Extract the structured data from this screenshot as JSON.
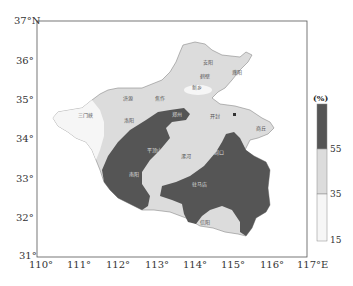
{
  "map": {
    "region": "Henan Province",
    "frame": {
      "lon_min": 110,
      "lon_max": 117,
      "lat_min": 31,
      "lat_max": 37
    },
    "x_ticks": [
      "110°",
      "111°",
      "112°",
      "113°",
      "114°",
      "115°",
      "116°",
      "117°E"
    ],
    "y_ticks": [
      "37°N",
      "36°",
      "35°",
      "34°",
      "33°",
      "32°",
      "31°"
    ],
    "cities": [
      {
        "name": "安阳",
        "x": 203,
        "y": 60
      },
      {
        "name": "鹤壁",
        "x": 200,
        "y": 74
      },
      {
        "name": "濮阳",
        "x": 232,
        "y": 70
      },
      {
        "name": "新乡",
        "x": 192,
        "y": 85
      },
      {
        "name": "焦作",
        "x": 155,
        "y": 96
      },
      {
        "name": "济源",
        "x": 123,
        "y": 96
      },
      {
        "name": "三门峡",
        "x": 80,
        "y": 113
      },
      {
        "name": "洛阳",
        "x": 124,
        "y": 118
      },
      {
        "name": "郑州",
        "x": 172,
        "y": 112
      },
      {
        "name": "开封",
        "x": 210,
        "y": 114
      },
      {
        "name": "商丘",
        "x": 257,
        "y": 126
      },
      {
        "name": "许昌",
        "x": 174,
        "y": 137
      },
      {
        "name": "平顶山",
        "x": 148,
        "y": 148
      },
      {
        "name": "漯河",
        "x": 181,
        "y": 154
      },
      {
        "name": "周口",
        "x": 214,
        "y": 150
      },
      {
        "name": "南阳",
        "x": 129,
        "y": 172
      },
      {
        "name": "驻马店",
        "x": 193,
        "y": 182
      },
      {
        "name": "信阳",
        "x": 201,
        "y": 220
      }
    ]
  },
  "legend": {
    "title": "(%)",
    "labels": [
      "55",
      "35",
      "15"
    ],
    "colors": {
      "high": "#555555",
      "mid": "#dcdcdc",
      "low": "#f6f6f6"
    }
  }
}
